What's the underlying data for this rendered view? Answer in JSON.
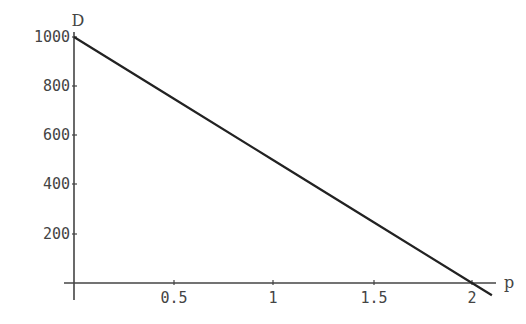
{
  "chart_data": {
    "type": "line",
    "title": "",
    "xlabel": "p",
    "ylabel": "D",
    "x_ticks": [
      "0.5",
      "1",
      "1.5",
      "2"
    ],
    "y_ticks": [
      "200",
      "400",
      "600",
      "800",
      "1000"
    ],
    "xlim": [
      0,
      2.1
    ],
    "ylim": [
      0,
      1000
    ],
    "grid": false,
    "legend": null,
    "series": [
      {
        "name": "D(p)",
        "x": [
          0,
          0.5,
          1,
          1.5,
          2,
          2.1
        ],
        "values": [
          1000,
          750,
          500,
          250,
          0,
          -50
        ]
      }
    ],
    "colors": {
      "line": "#222222",
      "axes": "#444444",
      "text": "#444444"
    }
  }
}
